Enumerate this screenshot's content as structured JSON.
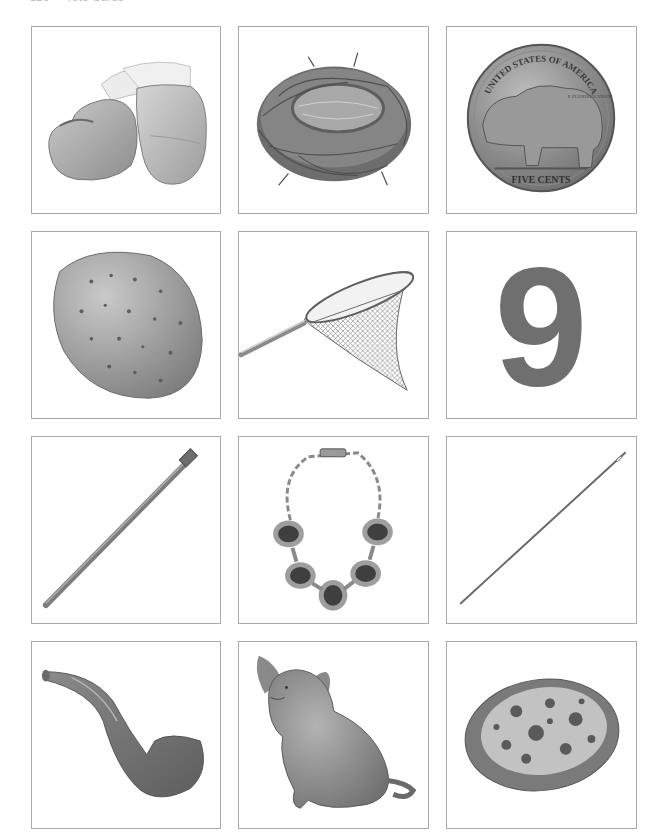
{
  "page": {
    "header": {
      "page_number": "120",
      "title": "Tote Cards"
    }
  },
  "cards": [
    {
      "label": "mittens",
      "icon": "mittens-icon"
    },
    {
      "label": "nest",
      "icon": "nest-icon"
    },
    {
      "label": "nickel",
      "icon": "nickel-icon",
      "coin_top_text": "UNITED STATES OF AMERICA",
      "coin_motto": "E PLURIBUS UNUM",
      "coin_bottom_text": "FIVE CENTS"
    },
    {
      "label": "nut",
      "icon": "almond-icon"
    },
    {
      "label": "net",
      "icon": "fishing-net-icon"
    },
    {
      "label": "nine",
      "icon": "number-nine-icon",
      "numeral": "9"
    },
    {
      "label": "nail",
      "icon": "nail-icon"
    },
    {
      "label": "necklace",
      "icon": "necklace-icon"
    },
    {
      "label": "needle",
      "icon": "needle-icon"
    },
    {
      "label": "pipe",
      "icon": "pipe-icon"
    },
    {
      "label": "pig",
      "icon": "pig-icon"
    },
    {
      "label": "pizza",
      "icon": "pizza-icon"
    }
  ]
}
